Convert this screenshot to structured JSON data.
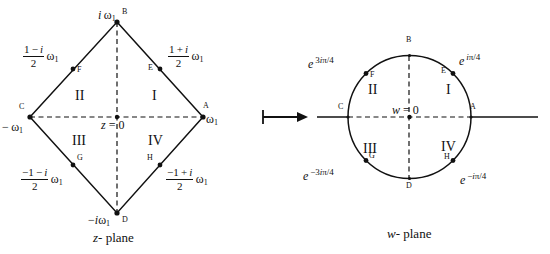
{
  "figure": {
    "z_plane": {
      "caption": "z - plane",
      "origin_label": "z = 0",
      "vertices": [
        {
          "id": "A",
          "point_label": "A",
          "value": "ω₁",
          "position": "right"
        },
        {
          "id": "B",
          "point_label": "B",
          "value": "i ω₁",
          "position": "top"
        },
        {
          "id": "C",
          "point_label": "C",
          "value": "− ω₁",
          "position": "left"
        },
        {
          "id": "D",
          "point_label": "D",
          "value": "− i ω₁",
          "position": "bottom"
        }
      ],
      "midpoints": [
        {
          "id": "E",
          "point_label": "E",
          "numerator": "1 + i",
          "denominator": "2",
          "sign": "",
          "suffix": "ω₁",
          "value": "(1+i)/2 ω₁"
        },
        {
          "id": "F",
          "point_label": "F",
          "numerator": "1 − i",
          "denominator": "2",
          "sign": "",
          "suffix": "ω₁",
          "value": "(1−i)/2 ω₁"
        },
        {
          "id": "G",
          "point_label": "G",
          "numerator": "1 − i",
          "denominator": "2",
          "sign": "−",
          "suffix": "ω₁",
          "value": "−(1−i)/2 ω₁"
        },
        {
          "id": "H",
          "point_label": "H",
          "numerator": "1 + i",
          "denominator": "2",
          "sign": "−",
          "suffix": "ω₁",
          "value": "−(1+i)/2 ω₁"
        }
      ],
      "quadrants": [
        {
          "id": "I",
          "label": "I"
        },
        {
          "id": "II",
          "label": "II"
        },
        {
          "id": "III",
          "label": "III"
        },
        {
          "id": "IV",
          "label": "IV"
        }
      ]
    },
    "w_plane": {
      "caption": "w - plane",
      "origin_label": "w = 0",
      "vertices": [
        {
          "id": "A",
          "point_label": "A",
          "position": "right"
        },
        {
          "id": "B",
          "point_label": "B",
          "position": "top"
        },
        {
          "id": "C",
          "point_label": "C",
          "position": "left"
        },
        {
          "id": "D",
          "point_label": "D",
          "position": "bottom"
        }
      ],
      "midpoints": [
        {
          "id": "E",
          "point_label": "E",
          "base": "e",
          "exponent": "iπ/4",
          "value": "e^{iπ/4}"
        },
        {
          "id": "F",
          "point_label": "F",
          "base": "e",
          "exponent": "3iπ/4",
          "value": "e^{3iπ/4}"
        },
        {
          "id": "G",
          "point_label": "G",
          "base": "e",
          "exponent": "−3iπ/4",
          "value": "e^{−3iπ/4}"
        },
        {
          "id": "H",
          "point_label": "H",
          "base": "e",
          "exponent": "−iπ/4",
          "value": "e^{−iπ/4}"
        }
      ],
      "quadrants": [
        {
          "id": "I",
          "label": "I"
        },
        {
          "id": "II",
          "label": "II"
        },
        {
          "id": "III",
          "label": "III"
        },
        {
          "id": "IV",
          "label": "IV"
        }
      ]
    },
    "mapping_arrow": {
      "symbol": "↦",
      "name": "maps-to"
    },
    "colors": {
      "stroke": "#111111",
      "background": "#ffffff"
    }
  }
}
